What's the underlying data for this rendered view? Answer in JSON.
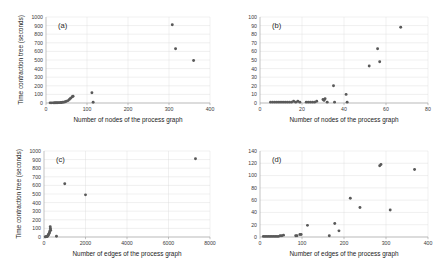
{
  "figure": {
    "marker_color": "#595959",
    "grid_color": "#d8d8d8",
    "axis_color": "#9a9a9a"
  },
  "chart_data": [
    {
      "type": "scatter",
      "panel": "(a)",
      "title": "",
      "xlabel": "Number of nodes of the process graph",
      "ylabel": "Time contraction tree (seconds)",
      "xlim": [
        0,
        400
      ],
      "ylim": [
        0,
        1000
      ],
      "xticks": [
        0,
        100,
        200,
        300,
        400
      ],
      "yticks": [
        0,
        100,
        200,
        300,
        400,
        500,
        600,
        700,
        800,
        900,
        1000
      ],
      "grid": true,
      "legend": "none",
      "points": [
        [
          10,
          2
        ],
        [
          14,
          2
        ],
        [
          18,
          2
        ],
        [
          21,
          3
        ],
        [
          24,
          3
        ],
        [
          27,
          3
        ],
        [
          30,
          4
        ],
        [
          33,
          4
        ],
        [
          36,
          5
        ],
        [
          38,
          6
        ],
        [
          41,
          8
        ],
        [
          44,
          10
        ],
        [
          47,
          14
        ],
        [
          50,
          20
        ],
        [
          54,
          28
        ],
        [
          57,
          42
        ],
        [
          60,
          56
        ],
        [
          64,
          72
        ],
        [
          66,
          78
        ],
        [
          112,
          120
        ],
        [
          115,
          8
        ],
        [
          308,
          910
        ],
        [
          316,
          630
        ],
        [
          360,
          495
        ]
      ]
    },
    {
      "type": "scatter",
      "panel": "(b)",
      "title": "",
      "xlabel": "Number of nodes of the process graph",
      "ylabel": "",
      "xlim": [
        0,
        80
      ],
      "ylim": [
        0,
        100
      ],
      "xticks": [
        0,
        20,
        40,
        60,
        80
      ],
      "yticks": [
        0,
        10,
        20,
        30,
        40,
        50,
        60,
        70,
        80,
        90,
        100
      ],
      "grid": true,
      "legend": "none",
      "points": [
        [
          5,
          1
        ],
        [
          6,
          1
        ],
        [
          7,
          1
        ],
        [
          8,
          1
        ],
        [
          9,
          1
        ],
        [
          10,
          1
        ],
        [
          11,
          1
        ],
        [
          12,
          1
        ],
        [
          13,
          1
        ],
        [
          14,
          1
        ],
        [
          15,
          1
        ],
        [
          16,
          2
        ],
        [
          17,
          1
        ],
        [
          18,
          2
        ],
        [
          19,
          1
        ],
        [
          22,
          1
        ],
        [
          23,
          1
        ],
        [
          24,
          1
        ],
        [
          25,
          1
        ],
        [
          26,
          1
        ],
        [
          27,
          2
        ],
        [
          30,
          4
        ],
        [
          30.5,
          3
        ],
        [
          31,
          5
        ],
        [
          32,
          1
        ],
        [
          35,
          20
        ],
        [
          35.5,
          1
        ],
        [
          41,
          10
        ],
        [
          41.5,
          1
        ],
        [
          52,
          43
        ],
        [
          56,
          63
        ],
        [
          57,
          48
        ],
        [
          67,
          88
        ]
      ]
    },
    {
      "type": "scatter",
      "panel": "(c)",
      "title": "",
      "xlabel": "Number of edges of the process graph",
      "ylabel": "Time contraction tree (seconds)",
      "xlim": [
        0,
        8000
      ],
      "ylim": [
        0,
        1000
      ],
      "xticks": [
        0,
        2000,
        4000,
        6000,
        8000
      ],
      "yticks": [
        0,
        100,
        200,
        300,
        400,
        500,
        600,
        700,
        800,
        900,
        1000
      ],
      "grid": true,
      "legend": "none",
      "points": [
        [
          60,
          2
        ],
        [
          90,
          3
        ],
        [
          120,
          4
        ],
        [
          150,
          6
        ],
        [
          170,
          10
        ],
        [
          190,
          16
        ],
        [
          210,
          24
        ],
        [
          230,
          34
        ],
        [
          250,
          45
        ],
        [
          270,
          58
        ],
        [
          290,
          72
        ],
        [
          300,
          120
        ],
        [
          310,
          100
        ],
        [
          320,
          78
        ],
        [
          600,
          8
        ],
        [
          1000,
          620
        ],
        [
          2000,
          490
        ],
        [
          7300,
          910
        ]
      ]
    },
    {
      "type": "scatter",
      "panel": "(d)",
      "title": "",
      "xlabel": "Number of edges of the process graph",
      "ylabel": "",
      "xlim": [
        0,
        400
      ],
      "ylim": [
        0,
        140
      ],
      "xticks": [
        0,
        100,
        200,
        300,
        400
      ],
      "yticks": [
        0,
        20,
        40,
        60,
        80,
        100,
        120,
        140
      ],
      "grid": true,
      "legend": "none",
      "points": [
        [
          8,
          1
        ],
        [
          12,
          1
        ],
        [
          16,
          1
        ],
        [
          20,
          1
        ],
        [
          24,
          1
        ],
        [
          28,
          1
        ],
        [
          32,
          1
        ],
        [
          36,
          1
        ],
        [
          40,
          1
        ],
        [
          44,
          1
        ],
        [
          48,
          2
        ],
        [
          52,
          2
        ],
        [
          56,
          3
        ],
        [
          85,
          2
        ],
        [
          88,
          2
        ],
        [
          95,
          4
        ],
        [
          98,
          4
        ],
        [
          113,
          19
        ],
        [
          165,
          2
        ],
        [
          178,
          22
        ],
        [
          188,
          10
        ],
        [
          215,
          63
        ],
        [
          238,
          48
        ],
        [
          285,
          116
        ],
        [
          288,
          118
        ],
        [
          310,
          44
        ],
        [
          368,
          110
        ]
      ]
    }
  ]
}
